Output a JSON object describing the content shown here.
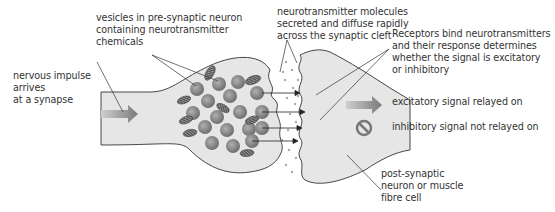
{
  "diagram": {
    "labels": {
      "vesicles": "vesicles in pre-synaptic neuron\ncontaining neurotransmitter\nchemicals",
      "neurotransmitter": "neurotransmitter molecules\nsecreted and diffuse rapidly\nacross the synaptic cleft",
      "receptors": "Receptors bind neurotransmitters\nand their response determines\nwhether the signal is excitatory\nor inhibitory",
      "impulse": "nervous impulse\narrives\nat a synapse",
      "excitatory": "excitatory signal relayed on",
      "inhibitory": "inhibitory signal not relayed on",
      "postsynaptic": "post-synaptic\nneuron or muscle\nfibre cell"
    },
    "icons": {
      "excitatory": "right-arrow-icon",
      "inhibitory": "no-entry-icon",
      "impulse": "right-arrow-icon"
    },
    "colors": {
      "cell_fill": "#e6e6e6",
      "outline": "#333333",
      "vesicle": "#8a8a8a",
      "mitochondria": "#4a4a4a",
      "arrow": "#8c8c8c",
      "text": "#333333"
    }
  }
}
